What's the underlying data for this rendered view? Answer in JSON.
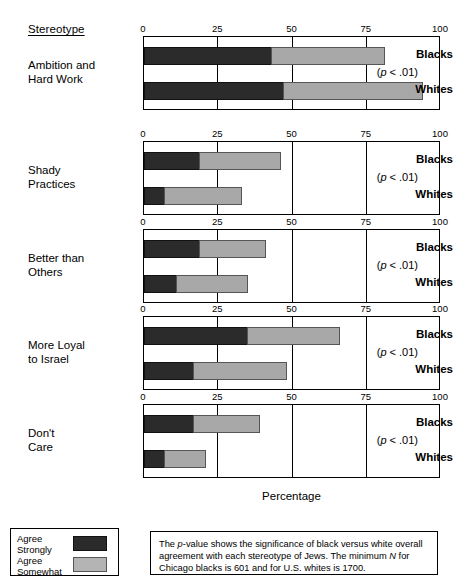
{
  "header": {
    "stereotype_label": "Stereotype"
  },
  "axis": {
    "ticks": [
      "0",
      "25",
      "50",
      "75",
      "100"
    ],
    "tick_values": [
      0,
      25,
      50,
      75,
      100
    ],
    "x_title": "Percentage",
    "xlim": [
      0,
      100
    ]
  },
  "group_labels": {
    "blacks": "Blacks",
    "whites": "Whites"
  },
  "pvalue_text_prefix": "(",
  "pvalue_text_suffix": " < .01)",
  "pvalue_italic": "p",
  "legend": {
    "items": [
      {
        "label_line1": "Agree",
        "label_line2": "Strongly",
        "color": "#2b2b2b",
        "key": "agree-strongly"
      },
      {
        "label_line1": "Agree",
        "label_line2": "Somewhat",
        "color": "#b4b4b4",
        "key": "agree-somewhat"
      }
    ]
  },
  "note": {
    "part1": "The ",
    "italic1": "p",
    "part2": "-value shows the significance of black versus white overall agreement with each stereotype of Jews.  The minimum ",
    "italic2": "N",
    "part3": " for Chicago blacks is 601 and for U.S. whites is 1700."
  },
  "chart_data": {
    "type": "bar",
    "orientation": "horizontal",
    "stacked": true,
    "title": "",
    "xlabel": "Percentage",
    "ylabel": "Stereotype",
    "xlim": [
      0,
      100
    ],
    "xticks": [
      0,
      25,
      50,
      75,
      100
    ],
    "grid": true,
    "legend_position": "bottom-left",
    "series": [
      {
        "name": "Agree Strongly",
        "color": "#2b2b2b"
      },
      {
        "name": "Agree Somewhat",
        "color": "#a8a8a8"
      }
    ],
    "panels": [
      {
        "category": "Ambition and Hard Work",
        "category_lines": [
          "Ambition and",
          "Hard Work"
        ],
        "pvalue": "(p < .01)",
        "bars": [
          {
            "group": "Blacks",
            "agree_strongly": 43,
            "agree_somewhat": 38,
            "total": 81
          },
          {
            "group": "Whites",
            "agree_strongly": 47,
            "agree_somewhat": 47,
            "total": 94
          }
        ]
      },
      {
        "category": "Shady Practices",
        "category_lines": [
          "Shady",
          "Practices"
        ],
        "pvalue": "(p < .01)",
        "bars": [
          {
            "group": "Blacks",
            "agree_strongly": 19,
            "agree_somewhat": 27,
            "total": 46
          },
          {
            "group": "Whites",
            "agree_strongly": 7,
            "agree_somewhat": 26,
            "total": 33
          }
        ]
      },
      {
        "category": "Better than Others",
        "category_lines": [
          "Better than",
          "Others"
        ],
        "pvalue": "(p < .01)",
        "bars": [
          {
            "group": "Blacks",
            "agree_strongly": 19,
            "agree_somewhat": 22,
            "total": 41
          },
          {
            "group": "Whites",
            "agree_strongly": 11,
            "agree_somewhat": 24,
            "total": 35
          }
        ]
      },
      {
        "category": "More Loyal to Israel",
        "category_lines": [
          "More Loyal",
          "to Israel"
        ],
        "pvalue": "(p < .01)",
        "bars": [
          {
            "group": "Blacks",
            "agree_strongly": 35,
            "agree_somewhat": 31,
            "total": 66
          },
          {
            "group": "Whites",
            "agree_strongly": 17,
            "agree_somewhat": 31,
            "total": 48
          }
        ]
      },
      {
        "category": "Don't Care",
        "category_lines": [
          "Don't",
          "Care"
        ],
        "pvalue": "(p < .01)",
        "bars": [
          {
            "group": "Blacks",
            "agree_strongly": 17,
            "agree_somewhat": 22,
            "total": 39
          },
          {
            "group": "Whites",
            "agree_strongly": 7,
            "agree_somewhat": 14,
            "total": 21
          }
        ]
      }
    ]
  }
}
